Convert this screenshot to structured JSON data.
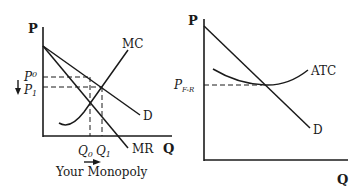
{
  "left_graph": {
    "y_axis_label": "P",
    "x_axis_label": "Q",
    "curves": {
      "mc": "MC",
      "demand": "D",
      "mr": "MR"
    },
    "price_labels": {
      "p0_main": "P",
      "p0_sub": "0",
      "p1_main": "P",
      "p1_sub": "1"
    },
    "quantity_labels": {
      "q0_main": "Q",
      "q0_sub": "0",
      "q1_main": "Q",
      "q1_sub": "1"
    },
    "caption": "Your Monopoly",
    "arrows": [
      "down-arrow (price decrease)",
      "right-arrow (quantity increase)"
    ]
  },
  "right_graph": {
    "y_axis_label": "P",
    "x_axis_label": "Q",
    "curves": {
      "atc": "ATC",
      "demand": "D"
    },
    "price_labels": {
      "pfr_main": "P",
      "pfr_sub": "F-R"
    }
  },
  "colors": {
    "ink": "#1a1a1a",
    "background": "#ffffff"
  }
}
